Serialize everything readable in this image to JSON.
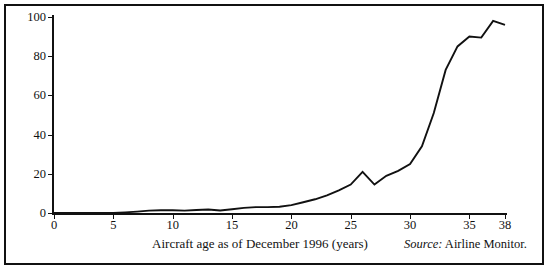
{
  "figure": {
    "border_color": "#111111",
    "background": "#ffffff",
    "line_color": "#111111"
  },
  "source_note": {
    "prefix": "Source:",
    "text": "Airline Monitor."
  },
  "chart_data": {
    "type": "line",
    "title": "",
    "subtitle": "",
    "xlabel": "Aircraft age as of December 1996 (years)",
    "ylabel": "% of deliveries retire",
    "xlim": [
      0,
      38
    ],
    "ylim": [
      0,
      100
    ],
    "grid": false,
    "legend": false,
    "legend_position": "none",
    "xticks": [
      0,
      5,
      10,
      15,
      20,
      25,
      30,
      35,
      38
    ],
    "xtick_labels": [
      "0",
      "5",
      "10",
      "15",
      "20",
      "25",
      "30",
      "35",
      "38"
    ],
    "yticks": [
      0,
      20,
      40,
      60,
      80,
      100
    ],
    "ytick_labels": [
      "0",
      "20",
      "40",
      "60",
      "80",
      "100"
    ],
    "series": [
      {
        "name": "% of deliveries retired",
        "x": [
          0,
          1,
          2,
          3,
          4,
          5,
          6,
          7,
          8,
          9,
          10,
          11,
          12,
          13,
          14,
          15,
          16,
          17,
          18,
          19,
          20,
          21,
          22,
          23,
          24,
          25,
          26,
          27,
          28,
          29,
          30,
          31,
          32,
          33,
          34,
          35,
          36,
          37,
          38
        ],
        "values": [
          0,
          0,
          0,
          0,
          0,
          0,
          0.3,
          0.7,
          1.2,
          1.4,
          1.4,
          1.2,
          1.5,
          1.8,
          1.3,
          1.9,
          2.6,
          3.0,
          3.0,
          3.2,
          4.0,
          5.5,
          7.0,
          9.0,
          11.5,
          14.5,
          21.0,
          14.5,
          19.0,
          21.5,
          25.0,
          34.0,
          51.0,
          73.0,
          85.0,
          90.0,
          89.5,
          98.0,
          96.0
        ]
      }
    ]
  }
}
